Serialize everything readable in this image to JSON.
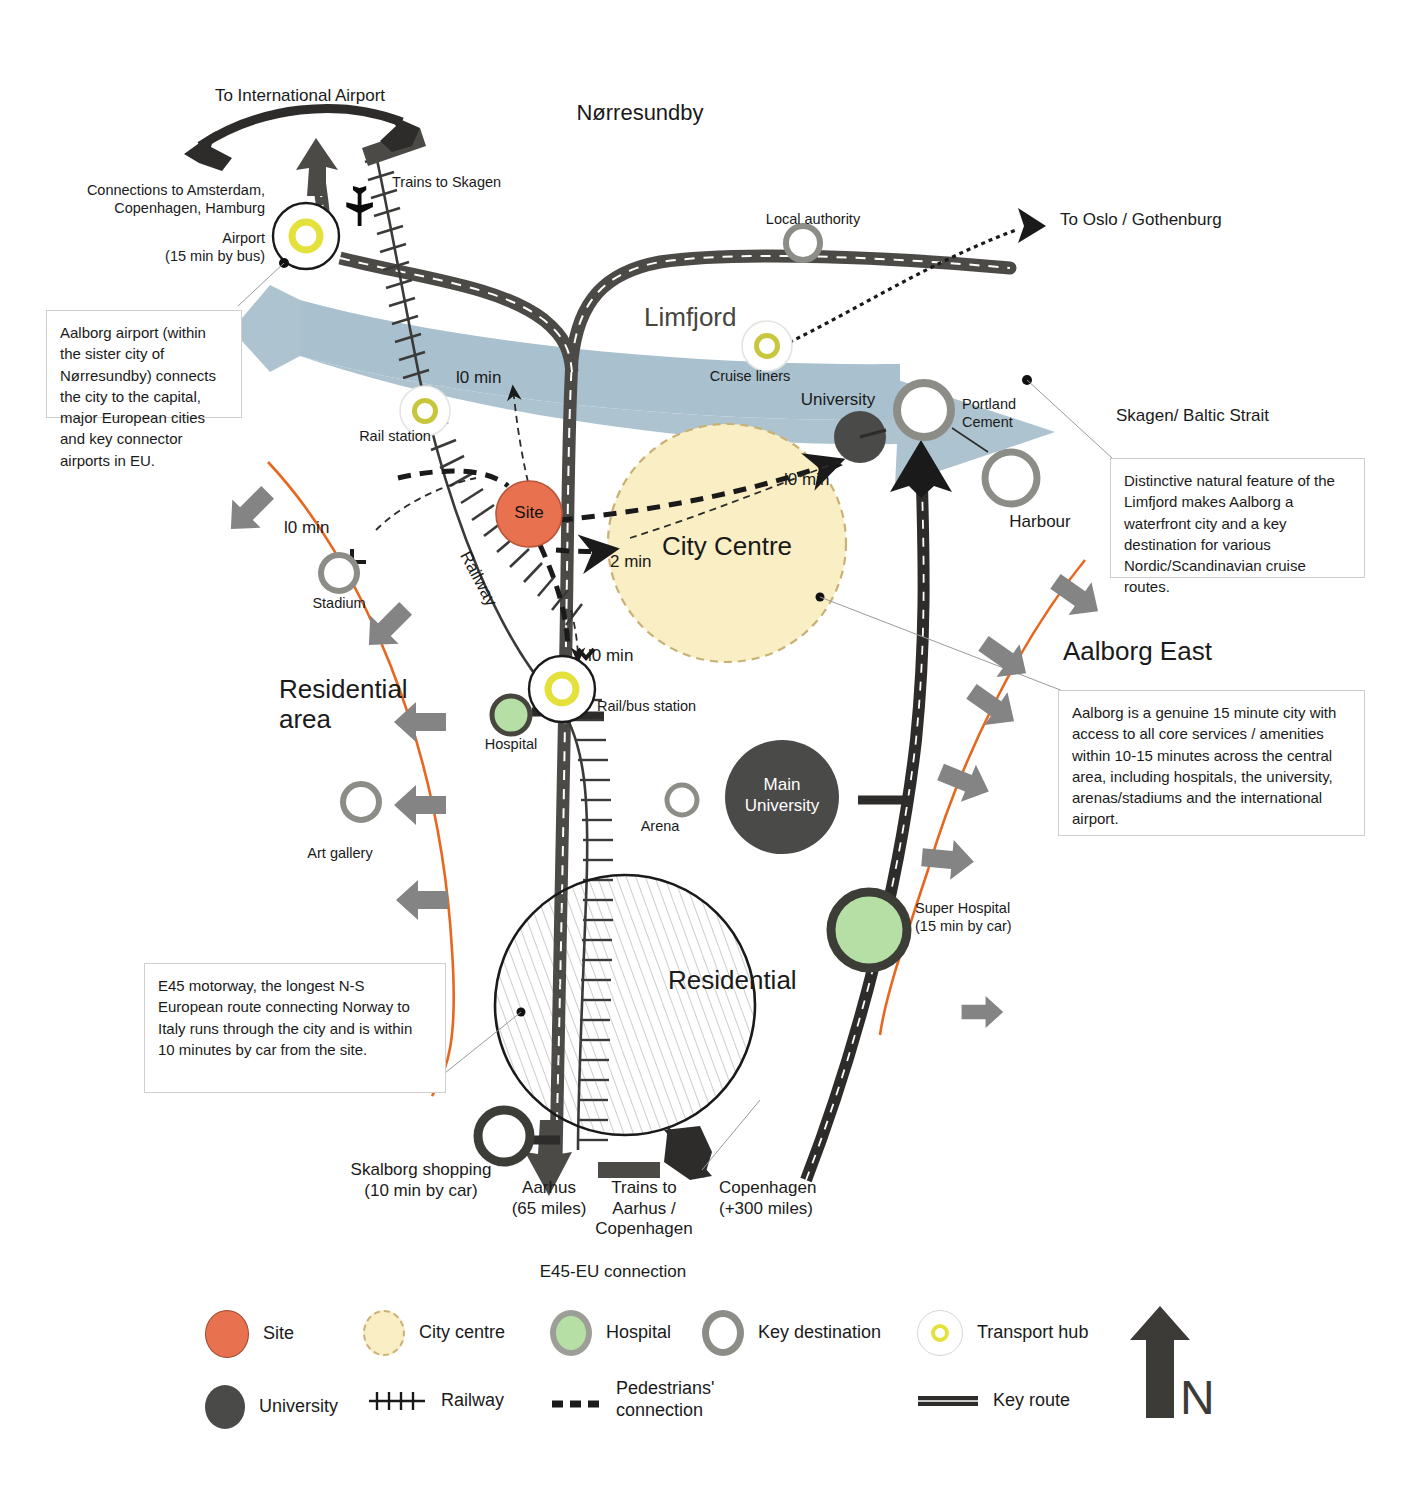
{
  "diagram": {
    "colors": {
      "site": "#e8714f",
      "city_centre_fill": "#f9eec4",
      "city_centre_stroke": "#c9b174",
      "hospital_fill": "#b5dfa4",
      "university": "#4a4a48",
      "key_destination_stroke": "#8d8d88",
      "transport_hub_ring": "#e4e03c",
      "water": "#a9c0ce",
      "road": "#4c4a47",
      "isochrone": "#e8671f",
      "arrow_grey": "#848484"
    }
  },
  "areas": {
    "norresundby": "Nørresundby",
    "limfjord": "Limfjord",
    "city_centre": "City Centre",
    "residential_area": "Residential\narea",
    "residential": "Residential",
    "aalborg_east": "Aalborg East"
  },
  "places": {
    "airport": "Airport\n(15 min by bus)",
    "rail_station": "Rail station",
    "site": "Site",
    "stadium": "Stadium",
    "art_gallery": "Art gallery",
    "hospital": "Hospital",
    "rail_bus_station": "Rail/bus station",
    "arena": "Arena",
    "main_university": "Main\nUniversity",
    "super_hospital": "Super Hospital\n(15 min by car)",
    "local_authority": "Local authority",
    "cruise_liners": "Cruise liners",
    "university": "University",
    "portland_cement": "Portland\nCement",
    "harbour": "Harbour",
    "skalborg_shopping": "Skalborg shopping\n(10 min by car)"
  },
  "routes": {
    "to_international_airport": "To International Airport",
    "connections_to": "Connections to Amsterdam,\nCopenhagen, Hamburg",
    "trains_to_skagen": "Trains to Skagen",
    "to_oslo_gothenburg": "To Oslo / Gothenburg",
    "skagen_baltic_strait": "Skagen/ Baltic Strait",
    "railway": "Railway",
    "aarhus": "Aarhus\n(65 miles)",
    "trains_to_aarhus_copenhagen": "Trains to\nAarhus /\nCopenhagen",
    "copenhagen": "Copenhagen\n(+300 miles)",
    "e45_eu_connection": "E45-EU connection"
  },
  "times": {
    "site_north": "l0 min",
    "stadium": "l0 min",
    "city_centre_ne": "l0 min",
    "site_to_centre": "2 min",
    "rail_bus": "l0 min"
  },
  "callouts": {
    "airport": "Aalborg airport (within the sister city of Nørresundby) connects the city to the capital, major European cities and key connector airports in EU.",
    "limfjord": "Distinctive natural feature of the Limfjord makes Aalborg a waterfront city and a key destination for various Nordic/Scandinavian cruise routes.",
    "fifteen_minute_city": "Aalborg is a genuine 15 minute city with access to all core services / amenities within 10-15 minutes across the central area, including hospitals, the university, arenas/stadiums and the international airport.",
    "e45": "E45 motorway, the longest N-S European route connecting Norway to Italy runs through the city and is within 10 minutes by car from the site."
  },
  "legend": {
    "items": [
      {
        "key": "site",
        "label": "Site",
        "swatch": "site-circle-icon"
      },
      {
        "key": "city_centre",
        "label": "City centre",
        "swatch": "city-centre-circle-icon"
      },
      {
        "key": "hospital",
        "label": "Hospital",
        "swatch": "hospital-circle-icon"
      },
      {
        "key": "key_destination",
        "label": "Key destination",
        "swatch": "key-destination-ring-icon"
      },
      {
        "key": "transport_hub",
        "label": "Transport hub",
        "swatch": "transport-hub-icon"
      },
      {
        "key": "university",
        "label": "University",
        "swatch": "university-circle-icon"
      },
      {
        "key": "railway",
        "label": "Railway",
        "swatch": "railway-line-icon"
      },
      {
        "key": "pedestrians",
        "label": "Pedestrians'\nconnection",
        "swatch": "dashed-line-icon"
      },
      {
        "key": "key_route",
        "label": "Key route",
        "swatch": "key-route-line-icon"
      }
    ]
  },
  "compass": {
    "label": "N",
    "icon": "north-arrow-icon"
  }
}
